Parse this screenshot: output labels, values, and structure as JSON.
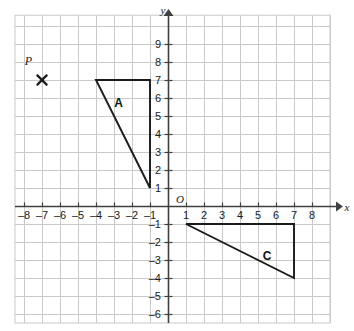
{
  "chart_data": {
    "type": "scatter",
    "title": "",
    "subtitle": "",
    "xlabel": "x",
    "ylabel": "y",
    "origin_label": "O",
    "xlim": [
      -8.5,
      9.0
    ],
    "ylim": [
      -6.5,
      10.6
    ],
    "grid": true,
    "grid_color": "#c9c9c9",
    "axis_color": "#404040",
    "shape_color": "#1a1a1a",
    "legend": "none",
    "x_ticks": [
      -8,
      -7,
      -6,
      -5,
      -4,
      -3,
      -2,
      -1,
      1,
      2,
      3,
      4,
      5,
      6,
      7,
      8
    ],
    "y_ticks": [
      9,
      8,
      7,
      6,
      5,
      4,
      3,
      2,
      1,
      -1,
      -2,
      -3,
      -4,
      -5,
      -6
    ],
    "x_tick_labels": [
      "–8",
      "–7",
      "–6",
      "–5",
      "–4",
      "–3",
      "–2",
      "–1",
      "1",
      "2",
      "3",
      "4",
      "5",
      "6",
      "7",
      "8"
    ],
    "y_tick_labels": [
      "9",
      "8",
      "7",
      "6",
      "5",
      "4",
      "3",
      "2",
      "1",
      "–1",
      "–2",
      "–3",
      "–4",
      "–5",
      "–6"
    ],
    "shapes": [
      {
        "name": "A",
        "label": "A",
        "type": "triangle",
        "vertices": [
          [
            -4,
            7
          ],
          [
            -1,
            7
          ],
          [
            -1,
            1
          ]
        ],
        "label_position": [
          -2.75,
          5.7
        ]
      },
      {
        "name": "C",
        "label": "C",
        "type": "triangle",
        "vertices": [
          [
            1,
            -1
          ],
          [
            7,
            -1
          ],
          [
            7,
            -4
          ]
        ],
        "label_position": [
          5.5,
          -2.75
        ]
      }
    ],
    "points": [
      {
        "name": "P",
        "label": "P",
        "marker": "x-cross",
        "coords": [
          -7,
          7
        ],
        "label_offset": [
          -0.75,
          0.85
        ]
      }
    ]
  }
}
